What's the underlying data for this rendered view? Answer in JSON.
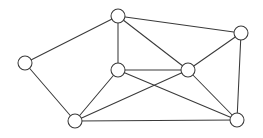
{
  "figure": {
    "type": "node-link-diagram",
    "width": 263,
    "height": 138,
    "background_color": "#ffffff",
    "stroke_color": "#3a3a3a",
    "vertex_fill_color": "#ffffff",
    "vertex_radius": 7,
    "stroke_width": 1.05,
    "vertex_count": 7,
    "edge_count": 13
  },
  "vertices": [
    {
      "id": "left",
      "label": "",
      "cx": 25,
      "cy": 63,
      "r": 7
    },
    {
      "id": "top",
      "label": "",
      "cx": 118,
      "cy": 16,
      "r": 7
    },
    {
      "id": "top-right",
      "label": "",
      "cx": 241,
      "cy": 33,
      "r": 7
    },
    {
      "id": "left-center",
      "label": "",
      "cx": 118,
      "cy": 70,
      "r": 7
    },
    {
      "id": "right-center",
      "label": "",
      "cx": 188,
      "cy": 70,
      "r": 7
    },
    {
      "id": "bottom-left",
      "label": "",
      "cx": 75,
      "cy": 121,
      "r": 7
    },
    {
      "id": "bottom-right",
      "label": "",
      "cx": 237,
      "cy": 120,
      "r": 7
    }
  ],
  "edges": [
    {
      "id": "e1",
      "from": "left",
      "to": "top",
      "x1": 25,
      "y1": 63,
      "x2": 118,
      "y2": 16
    },
    {
      "id": "e2",
      "from": "left",
      "to": "bottom-left",
      "x1": 25,
      "y1": 63,
      "x2": 75,
      "y2": 121
    },
    {
      "id": "e3",
      "from": "top",
      "to": "left-center",
      "x1": 118,
      "y1": 16,
      "x2": 118,
      "y2": 70
    },
    {
      "id": "e4",
      "from": "top",
      "to": "right-center",
      "x1": 118,
      "y1": 16,
      "x2": 188,
      "y2": 70
    },
    {
      "id": "e5",
      "from": "top",
      "to": "top-right",
      "x1": 118,
      "y1": 16,
      "x2": 241,
      "y2": 33
    },
    {
      "id": "e6",
      "from": "top-right",
      "to": "right-center",
      "x1": 241,
      "y1": 33,
      "x2": 188,
      "y2": 70
    },
    {
      "id": "e7",
      "from": "top-right",
      "to": "bottom-right",
      "x1": 241,
      "y1": 33,
      "x2": 237,
      "y2": 120
    },
    {
      "id": "e8",
      "from": "left-center",
      "to": "right-center",
      "x1": 118,
      "y1": 70,
      "x2": 188,
      "y2": 70
    },
    {
      "id": "e9",
      "from": "left-center",
      "to": "bottom-left",
      "x1": 118,
      "y1": 70,
      "x2": 75,
      "y2": 121
    },
    {
      "id": "e10",
      "from": "left-center",
      "to": "bottom-right",
      "x1": 118,
      "y1": 70,
      "x2": 237,
      "y2": 120
    },
    {
      "id": "e11",
      "from": "right-center",
      "to": "bottom-left",
      "x1": 188,
      "y1": 70,
      "x2": 75,
      "y2": 121
    },
    {
      "id": "e12",
      "from": "right-center",
      "to": "bottom-right",
      "x1": 188,
      "y1": 70,
      "x2": 237,
      "y2": 120
    },
    {
      "id": "e13",
      "from": "bottom-left",
      "to": "bottom-right",
      "x1": 75,
      "y1": 121,
      "x2": 237,
      "y2": 120
    }
  ]
}
